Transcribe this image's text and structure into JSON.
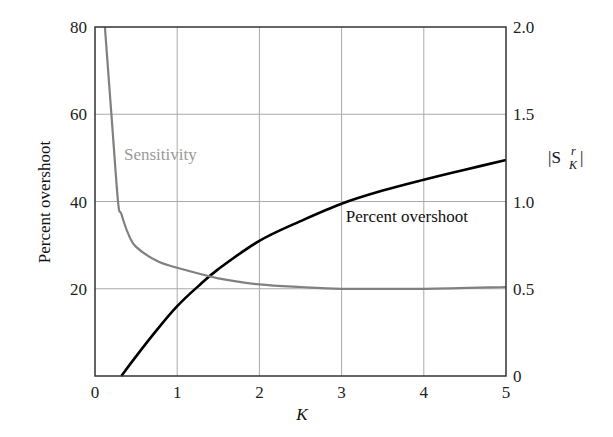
{
  "chart_data": {
    "type": "line",
    "title": "",
    "xlabel": "K",
    "ylabel": "Percent overshoot",
    "y2label": "|S_K^r|",
    "xlim": [
      0,
      5
    ],
    "ylim": [
      0,
      80
    ],
    "y2lim": [
      0,
      2.0
    ],
    "grid": true,
    "x_ticks": [
      "0",
      "1",
      "2",
      "3",
      "4",
      "5"
    ],
    "y_ticks": [
      "20",
      "40",
      "60",
      "80"
    ],
    "y2_ticks": [
      "0",
      "0.5",
      "1.0",
      "1.5",
      "2.0"
    ],
    "series": [
      {
        "name": "Percent overshoot",
        "axis": "left",
        "color": "#000000",
        "x": [
          0.32,
          0.5,
          0.75,
          1.0,
          1.25,
          1.5,
          2.0,
          2.5,
          3.0,
          3.5,
          4.0,
          4.5,
          5.0
        ],
        "values": [
          0,
          4.5,
          10.5,
          16,
          20.5,
          24.5,
          31,
          35.5,
          39.5,
          42.5,
          45,
          47.3,
          49.5
        ]
      },
      {
        "name": "Sensitivity",
        "axis": "right",
        "color": "#808080",
        "x": [
          0.12,
          0.2,
          0.28,
          0.32,
          0.4,
          0.5,
          0.75,
          1.0,
          1.5,
          2.0,
          2.5,
          3.0,
          4.0,
          5.0
        ],
        "values": [
          2.0,
          1.5,
          1.0,
          0.93,
          0.82,
          0.74,
          0.66,
          0.62,
          0.56,
          0.525,
          0.51,
          0.5,
          0.5,
          0.51
        ]
      }
    ],
    "annotations": [
      {
        "text": "Sensitivity",
        "color": "#888888"
      },
      {
        "text": "Percent overshoot",
        "color": "#000000"
      }
    ]
  },
  "labels": {
    "xlabel": "K",
    "ylabel": "Percent overshoot",
    "y2label_main": "|S",
    "y2label_sup": "r",
    "y2label_sub": "K",
    "y2label_end": "|",
    "sensitivity_annotation": "Sensitivity",
    "overshoot_annotation": "Percent overshoot"
  }
}
